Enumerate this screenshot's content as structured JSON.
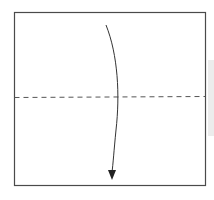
{
  "diagram": {
    "type": "origami-fold-step",
    "paper": {
      "x": 14,
      "y": 12,
      "width": 191,
      "height": 173,
      "stroke": "#4a4a4a"
    },
    "fold_line": {
      "style": "dashed",
      "orientation": "horizontal",
      "y": 97,
      "stroke": "#555555"
    },
    "arrow": {
      "direction": "down",
      "start": [
        106,
        25
      ],
      "control": [
        122,
        70
      ],
      "end": [
        112,
        178
      ],
      "stroke": "#333333"
    },
    "colors": {
      "background": "#ffffff",
      "shade": "#ececec"
    }
  }
}
